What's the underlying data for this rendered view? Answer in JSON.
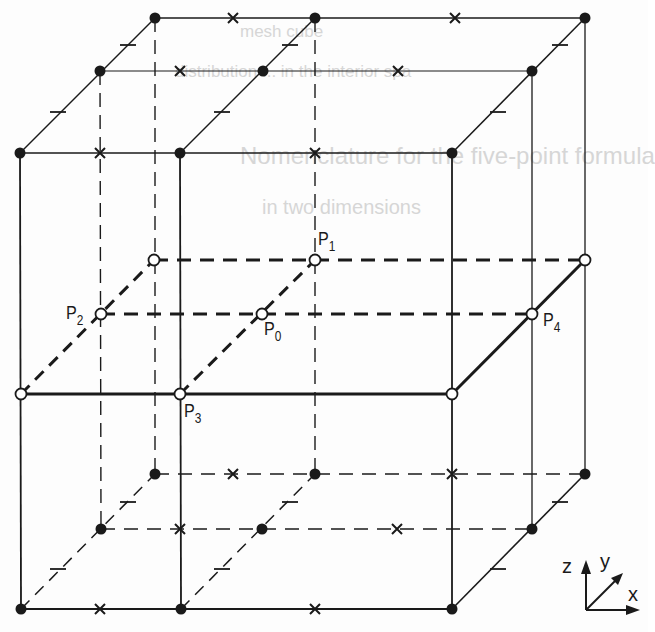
{
  "figure": {
    "title_visible": false,
    "colors": {
      "ink": "#1a1a1a",
      "background": "#fdfdfd",
      "ghost_text": "#d6d6d6",
      "open_point_fill": "#ffffff"
    }
  },
  "ghost_text": [
    {
      "text": "mesh cube",
      "x": 240,
      "y": 22,
      "size": 17
    },
    {
      "text": "distribution ... in the interior spa",
      "x": 175,
      "y": 62,
      "size": 17
    },
    {
      "text": "Nomenclature for the five-point formula",
      "x": 240,
      "y": 142,
      "size": 24
    },
    {
      "text": "in two dimensions",
      "x": 262,
      "y": 196,
      "size": 20
    }
  ],
  "point_labels": [
    {
      "id": "P0",
      "base": "P",
      "sub": "0",
      "x": 264,
      "y": 319
    },
    {
      "id": "P1",
      "base": "P",
      "sub": "1",
      "x": 318,
      "y": 229
    },
    {
      "id": "P2",
      "base": "P",
      "sub": "2",
      "x": 66,
      "y": 303
    },
    {
      "id": "P3",
      "base": "P",
      "sub": "3",
      "x": 184,
      "y": 401
    },
    {
      "id": "P4",
      "base": "P",
      "sub": "4",
      "x": 543,
      "y": 310
    }
  ],
  "axes": {
    "z_label": "z",
    "y_label": "y",
    "x_label": "x",
    "origin": [
      586,
      610
    ]
  },
  "legend": {
    "filled_circle": "mesh node (outer layers)",
    "open_circle": "mesh node (middle layer)",
    "x_mark": "edge midpoint",
    "tick_mark": "diagonal edge midpoint"
  }
}
